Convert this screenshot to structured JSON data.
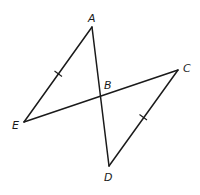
{
  "diagram": {
    "points": {
      "A": {
        "label": "A",
        "x": 92,
        "y": 27,
        "lx": 88,
        "ly": 22
      },
      "B": {
        "label": "B",
        "x": 101,
        "y": 96,
        "lx": 104,
        "ly": 89
      },
      "C": {
        "label": "C",
        "x": 178,
        "y": 70,
        "lx": 183,
        "ly": 72
      },
      "D": {
        "label": "D",
        "x": 109,
        "y": 166,
        "lx": 104,
        "ly": 181
      },
      "E": {
        "label": "E",
        "x": 24,
        "y": 122,
        "lx": 12,
        "ly": 129
      }
    },
    "segments": [
      {
        "name": "AE",
        "from": "A",
        "to": "E"
      },
      {
        "name": "AD",
        "from": "A",
        "to": "D"
      },
      {
        "name": "EC",
        "from": "E",
        "to": "C"
      },
      {
        "name": "CD",
        "from": "C",
        "to": "D"
      }
    ],
    "congruence_marks": [
      {
        "segment": "AE",
        "ticks": 1
      },
      {
        "segment": "CD",
        "ticks": 1
      }
    ],
    "colors": {
      "line": "#1a1a1a",
      "background": "#ffffff"
    }
  }
}
